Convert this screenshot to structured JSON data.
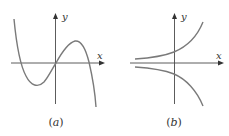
{
  "figure": {
    "panels": [
      {
        "id": "a",
        "caption_open": "(",
        "caption_letter": "a",
        "caption_close": ")",
        "x_label": "x",
        "y_label": "y",
        "description": "Cubic-like curve: decreasing from upper left, local minimum in the negative x region below the axis, passing through the origin, local maximum in positive x above the axis, then decreasing steeply to lower right."
      },
      {
        "id": "b",
        "caption_open": "(",
        "caption_letter": "b",
        "caption_close": ")",
        "x_label": "x",
        "y_label": "y",
        "description": "Two exponential-like curves: upper curve increasing, approaching x-axis from above as x goes left; lower curve decreasing, approaching x-axis from below as x goes left (mirror image)."
      }
    ],
    "colors": {
      "axis": "#4a4a4a",
      "curve": "#7a7a7a",
      "text": "#333333"
    }
  }
}
